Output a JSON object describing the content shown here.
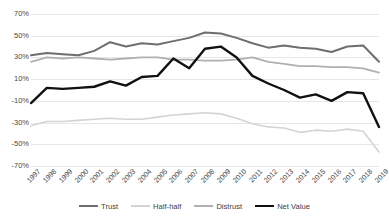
{
  "chart_data": {
    "type": "line",
    "title": "",
    "xlabel": "",
    "ylabel": "",
    "ylim": [
      -70,
      70
    ],
    "ytick_labels": [
      "70%",
      "50%",
      "30%",
      "10%",
      "-10%",
      "-30%",
      "-50%",
      "-70%"
    ],
    "ytick_values": [
      70,
      50,
      30,
      10,
      -10,
      -30,
      -50,
      -70
    ],
    "grid": true,
    "legend_position": "bottom",
    "x": [
      "1997",
      "1998",
      "1999",
      "2000",
      "2001",
      "2002",
      "2003",
      "2004",
      "2005",
      "2006",
      "2007",
      "2008",
      "2009",
      "2010",
      "2011",
      "2012",
      "2013",
      "2014",
      "2015",
      "2016",
      "2017",
      "2018",
      "2019"
    ],
    "categories": [
      "1997",
      "1998",
      "1999",
      "2000",
      "2001",
      "2002",
      "2003",
      "2004",
      "2005",
      "2006",
      "2007",
      "2008",
      "2009",
      "2010",
      "2011",
      "2012",
      "2013",
      "2014",
      "2015",
      "2016",
      "2017",
      "2018",
      "2019"
    ],
    "series": [
      {
        "name": "Trust",
        "color": "#6e6e6e",
        "width": 2.0,
        "values": [
          32,
          34,
          33,
          32,
          36,
          44,
          40,
          43,
          42,
          45,
          48,
          53,
          52,
          48,
          43,
          39,
          41,
          39,
          38,
          35,
          40,
          41,
          26
        ]
      },
      {
        "name": "Half-half",
        "color": "#d4d4d4",
        "width": 1.6,
        "values": [
          -33,
          -29,
          -29,
          -28,
          -27,
          -26,
          -27,
          -27,
          -25,
          -23,
          -22,
          -21,
          -22,
          -26,
          -31,
          -34,
          -35,
          -39,
          -37,
          -38,
          -36,
          -38,
          -57
        ]
      },
      {
        "name": "Distrust",
        "color": "#b0b0b0",
        "width": 1.8,
        "values": [
          26,
          30,
          29,
          30,
          29,
          28,
          29,
          30,
          30,
          28,
          28,
          27,
          27,
          28,
          30,
          26,
          24,
          22,
          22,
          21,
          21,
          20,
          16
        ]
      },
      {
        "name": "Net Value",
        "color": "#111111",
        "width": 2.4,
        "values": [
          -12,
          2,
          1,
          2,
          3,
          8,
          4,
          12,
          13,
          29,
          20,
          38,
          40,
          30,
          13,
          6,
          0,
          -7,
          -4,
          -10,
          -2,
          -3,
          -34
        ]
      }
    ]
  },
  "legend": {
    "items": [
      {
        "label": "Trust"
      },
      {
        "label": "Half-half"
      },
      {
        "label": "Distrust"
      },
      {
        "label": "Net Value"
      }
    ]
  }
}
